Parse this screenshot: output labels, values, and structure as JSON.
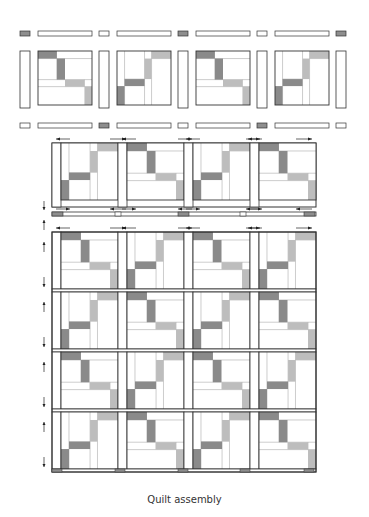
{
  "caption": "Quilt assembly",
  "colors": {
    "outline": "#333333",
    "thin_line": "#9a9a9a",
    "dark_fabric": "#8a8a8a",
    "light_fabric": "#bdbdbd",
    "background": "#ffffff",
    "cornerstone_dark": "#8e8e8e"
  },
  "layout": {
    "block_columns": 4,
    "block_rows": 4,
    "sashing_top_row_cornerstones": [
      "dark",
      "light",
      "dark",
      "light",
      "dark"
    ],
    "sashing_bottom_row_cornerstones": [
      "light",
      "dark",
      "light",
      "dark",
      "light"
    ],
    "block_variants": [
      "A",
      "B",
      "A",
      "B"
    ],
    "pressing_arrows": "Arrows indicate seam pressing direction"
  },
  "sections": [
    {
      "name": "exploded-row",
      "description": "Blocks with sashing strips and cornerstones, unsewn"
    },
    {
      "name": "sewn-block-row",
      "description": "One block row sewn with vertical sashing"
    },
    {
      "name": "sashing-strip-row",
      "description": "Horizontal sashing strip with cornerstones"
    },
    {
      "name": "assembled-quilt",
      "description": "Four rows of four blocks assembled"
    }
  ]
}
